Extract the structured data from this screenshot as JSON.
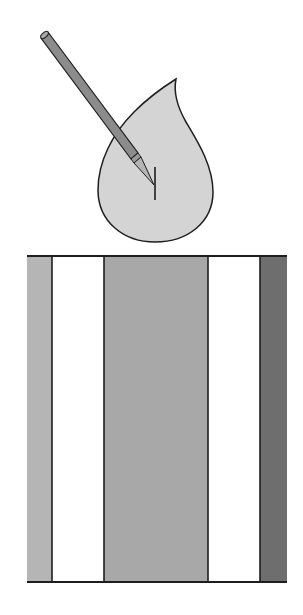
{
  "diagram": {
    "colors": {
      "background": "#ffffff",
      "outline": "#1e1e1e",
      "flame_fill": "#d4d4d4",
      "pencil_body": "#8c8c8c",
      "pencil_tip": "#b4b4b4",
      "wick": "#1e1e1e"
    },
    "flame": {
      "tip": [
        176,
        79
      ],
      "bottom": [
        155,
        242
      ]
    },
    "pencil": {
      "tail": [
        45,
        35
      ],
      "tip": [
        154,
        185
      ]
    },
    "wick": {
      "x": 155,
      "y1": 167,
      "y2": 200
    },
    "block": {
      "top": 256,
      "bottom": 582,
      "stripes": [
        {
          "name": "stripe-1",
          "x0": 27,
          "x1": 52,
          "fill": "#b5b5b5"
        },
        {
          "name": "stripe-2",
          "x0": 52,
          "x1": 104,
          "fill": "#ffffff"
        },
        {
          "name": "stripe-3",
          "x0": 104,
          "x1": 208,
          "fill": "#a8a8a8"
        },
        {
          "name": "stripe-4",
          "x0": 208,
          "x1": 260,
          "fill": "#ffffff"
        },
        {
          "name": "stripe-5",
          "x0": 260,
          "x1": 287,
          "fill": "#6e6e6e"
        }
      ]
    }
  }
}
